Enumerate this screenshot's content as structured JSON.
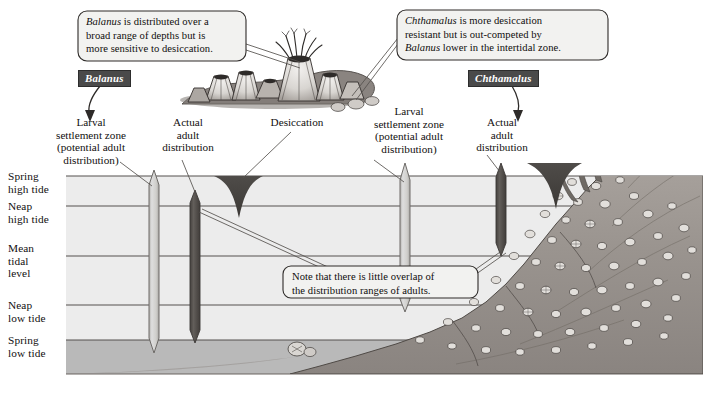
{
  "figure": {
    "type": "annotated-ecology-diagram",
    "caption": ""
  },
  "colors": {
    "water_intertidal": "#ececec",
    "water_subtidal": "#b9b9b9",
    "tide_line": "#55514e",
    "larval_bar": "#c9c9c7",
    "larval_bar_edge": "#6e6b68",
    "adult_bar": "#55514e",
    "desiccation_wedge": "#4a4744",
    "species_tag_bg": "#4a4a4a",
    "species_tag_text": "#ffffff",
    "rock": "#9c9793",
    "callout_bg": "#f2f2f0",
    "callout_border": "#3a3a3a"
  },
  "tide_levels": [
    {
      "id": "spring-high",
      "line1": "Spring",
      "line2": "high tide",
      "y": 176
    },
    {
      "id": "neap-high",
      "line1": "Neap",
      "line2": "high tide",
      "y": 206
    },
    {
      "id": "mean-tidal",
      "line1": "Mean",
      "line2": "tidal",
      "line3": "level",
      "y": 256
    },
    {
      "id": "neap-low",
      "line1": "Neap",
      "line2": "low tide",
      "y": 305
    },
    {
      "id": "spring-low",
      "line1": "Spring",
      "line2": "low tide",
      "y": 340
    }
  ],
  "callouts": [
    {
      "id": "balanus-callout",
      "line1_italic": "Balanus",
      "line1_rest": " is distributed over a",
      "line2": "broad range of depths but is",
      "line3": "more sensitive to desiccation."
    },
    {
      "id": "chthamalus-callout",
      "line1_italic": "Chthamalus",
      "line1_rest": " is more desiccation",
      "line2": "resistant but is out-competed by",
      "line3_italic": "Balanus",
      "line3_rest": " lower in the intertidal zone."
    },
    {
      "id": "overlap-callout",
      "line1": "Note that there is little overlap of",
      "line2": "the distribution ranges of adults."
    }
  ],
  "species_tags": [
    {
      "id": "balanus-tag",
      "label": "Balanus"
    },
    {
      "id": "chthamalus-tag",
      "label": "Chthamalus"
    }
  ],
  "zone_labels": [
    {
      "id": "balanus-larval",
      "line1": "Larval",
      "line2": "settlement zone",
      "line3": "(potential adult",
      "line4": "distribution)"
    },
    {
      "id": "balanus-adult",
      "line1": "Actual",
      "line2": "adult",
      "line3": "distribution"
    },
    {
      "id": "desiccation",
      "line1": "Desiccation"
    },
    {
      "id": "chthamalus-larval",
      "line1": "Larval",
      "line2": "settlement zone",
      "line3": "(potential adult",
      "line4": "distribution)"
    },
    {
      "id": "chthamalus-adult",
      "line1": "Actual",
      "line2": "adult",
      "line3": "distribution"
    }
  ],
  "distribution_bars": [
    {
      "id": "balanus-larval-bar",
      "species": "Balanus",
      "kind": "larval settlement zone",
      "top_level": "above spring high tide",
      "bottom_level": "below spring low tide"
    },
    {
      "id": "balanus-adult-bar",
      "species": "Balanus",
      "kind": "actual adult distribution",
      "top_level": "neap high tide",
      "bottom_level": "below spring low tide"
    },
    {
      "id": "chthamalus-larval-bar",
      "species": "Chthamalus",
      "kind": "larval settlement zone",
      "top_level": "above spring high tide",
      "bottom_level": "neap low tide"
    },
    {
      "id": "chthamalus-adult-bar",
      "species": "Chthamalus",
      "kind": "actual adult distribution",
      "top_level": "above spring high tide",
      "bottom_level": "mean tidal level"
    }
  ]
}
